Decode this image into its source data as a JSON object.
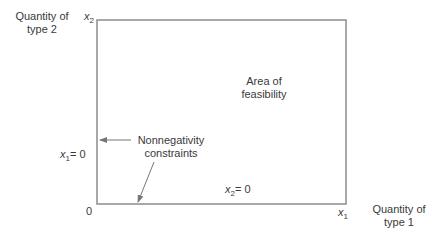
{
  "axes": {
    "y_axis_label_line1": "Quantity of",
    "y_axis_label_line2": "type 2",
    "x_axis_label_line1": "Quantity of",
    "x_axis_label_line2": "type 1",
    "y_var": "x",
    "y_var_sub": "2",
    "x_var": "x",
    "x_var_sub": "1",
    "origin": "0"
  },
  "region": {
    "label_line1": "Area of",
    "label_line2": "feasibility"
  },
  "constraints": {
    "label_line1": "Nonnegativity",
    "label_line2": "constraints",
    "x1_var": "x",
    "x1_sub": "1",
    "x1_eq": "= 0",
    "x2_var": "x",
    "x2_sub": "2",
    "x2_eq": "= 0"
  },
  "colors": {
    "box_stroke": "#8c8c8c",
    "text": "#3a3a3a",
    "background": "#ffffff"
  }
}
